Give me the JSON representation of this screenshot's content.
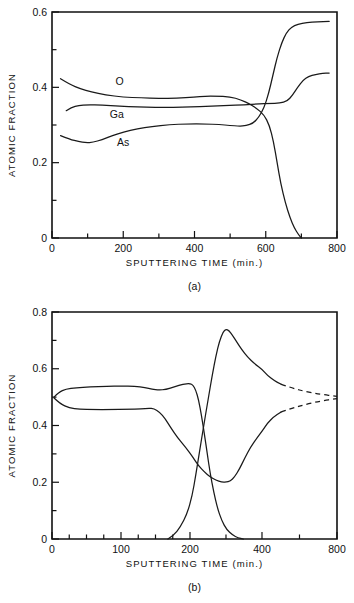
{
  "figure": {
    "title": "",
    "panels": [
      "a",
      "b"
    ]
  },
  "chart_data": [
    {
      "type": "line",
      "panel": "a",
      "caption": "(a)",
      "title": "",
      "xlabel": "SPUTTERING TIME (min.)",
      "ylabel": "ATOMIC FRACTION",
      "xlim": [
        0,
        800
      ],
      "ylim": [
        0,
        0.6
      ],
      "xticks": [
        0,
        100,
        200,
        300,
        400,
        500,
        600,
        700,
        800
      ],
      "xticklabels": [
        "0",
        "",
        "200",
        "",
        "400",
        "",
        "600",
        "",
        "800"
      ],
      "yticks": [
        0,
        0.1,
        0.2,
        0.3,
        0.4,
        0.5,
        0.6
      ],
      "yticklabels": [
        "0",
        "",
        "0.2",
        "",
        "0.4",
        "",
        "0.6"
      ],
      "x_scale": "linear",
      "grid": false,
      "legend": "inline-annotations",
      "series": [
        {
          "name": "O",
          "label": "O",
          "label_x": 190,
          "label_y": 0.415,
          "points": [
            [
              24,
              0.423
            ],
            [
              50,
              0.408
            ],
            [
              80,
              0.396
            ],
            [
              110,
              0.388
            ],
            [
              150,
              0.38
            ],
            [
              200,
              0.374
            ],
            [
              250,
              0.372
            ],
            [
              300,
              0.371
            ],
            [
              350,
              0.371
            ],
            [
              400,
              0.374
            ],
            [
              430,
              0.377
            ],
            [
              460,
              0.377
            ],
            [
              500,
              0.375
            ],
            [
              530,
              0.367
            ],
            [
              555,
              0.356
            ],
            [
              575,
              0.344
            ],
            [
              595,
              0.327
            ],
            [
              610,
              0.3
            ],
            [
              622,
              0.255
            ],
            [
              632,
              0.2
            ],
            [
              642,
              0.145
            ],
            [
              655,
              0.093
            ],
            [
              668,
              0.054
            ],
            [
              680,
              0.027
            ],
            [
              692,
              0.009
            ],
            [
              700,
              0.0
            ]
          ]
        },
        {
          "name": "Ga",
          "label": "Ga",
          "label_x": 182,
          "label_y": 0.328,
          "points": [
            [
              40,
              0.338
            ],
            [
              55,
              0.347
            ],
            [
              75,
              0.352
            ],
            [
              100,
              0.354
            ],
            [
              140,
              0.353
            ],
            [
              190,
              0.35
            ],
            [
              240,
              0.348
            ],
            [
              290,
              0.347
            ],
            [
              340,
              0.347
            ],
            [
              390,
              0.348
            ],
            [
              440,
              0.35
            ],
            [
              490,
              0.352
            ],
            [
              540,
              0.354
            ],
            [
              580,
              0.356
            ],
            [
              610,
              0.357
            ],
            [
              640,
              0.358
            ],
            [
              660,
              0.363
            ],
            [
              675,
              0.379
            ],
            [
              690,
              0.401
            ],
            [
              705,
              0.419
            ],
            [
              720,
              0.429
            ],
            [
              740,
              0.434
            ],
            [
              760,
              0.437
            ],
            [
              778,
              0.438
            ]
          ]
        },
        {
          "name": "As",
          "label": "As",
          "label_x": 200,
          "label_y": 0.253,
          "points": [
            [
              24,
              0.272
            ],
            [
              50,
              0.262
            ],
            [
              75,
              0.256
            ],
            [
              95,
              0.253
            ],
            [
              115,
              0.254
            ],
            [
              140,
              0.261
            ],
            [
              170,
              0.272
            ],
            [
              200,
              0.281
            ],
            [
              240,
              0.29
            ],
            [
              280,
              0.296
            ],
            [
              330,
              0.301
            ],
            [
              380,
              0.303
            ],
            [
              430,
              0.303
            ],
            [
              470,
              0.301
            ],
            [
              500,
              0.299
            ],
            [
              525,
              0.297
            ],
            [
              545,
              0.298
            ],
            [
              565,
              0.305
            ],
            [
              580,
              0.32
            ],
            [
              595,
              0.345
            ],
            [
              608,
              0.383
            ],
            [
              620,
              0.432
            ],
            [
              632,
              0.48
            ],
            [
              645,
              0.519
            ],
            [
              658,
              0.545
            ],
            [
              672,
              0.56
            ],
            [
              690,
              0.568
            ],
            [
              715,
              0.572
            ],
            [
              745,
              0.574
            ],
            [
              778,
              0.575
            ]
          ]
        }
      ]
    },
    {
      "type": "line",
      "panel": "b",
      "caption": "(b)",
      "title": "",
      "xlabel": "SPUTTERING TIME (min.)",
      "ylabel": "ATOMIC FRACTION",
      "xlim": [
        0,
        800
      ],
      "ylim": [
        0,
        0.8
      ],
      "xticks": [
        0,
        25,
        50,
        75,
        100,
        125,
        150,
        175,
        200,
        300,
        400,
        600,
        800
      ],
      "xticklabels": [
        "0",
        "",
        "",
        "",
        "100",
        "",
        "",
        "",
        "200",
        "",
        "400",
        "",
        "800"
      ],
      "yticks": [
        0,
        0.1,
        0.2,
        0.3,
        0.4,
        0.5,
        0.6,
        0.7,
        0.8
      ],
      "yticklabels": [
        "0",
        "",
        "0.2",
        "",
        "0.4",
        "",
        "0.6",
        "",
        "0.8"
      ],
      "x_scale": "broken-compressed",
      "x_breakpoints": [
        [
          0,
          200
        ],
        [
          200,
          400
        ],
        [
          400,
          800
        ]
      ],
      "grid": false,
      "legend": "none",
      "series": [
        {
          "name": "upper-branch",
          "label": "",
          "points": [
            [
              3,
              0.5
            ],
            [
              10,
              0.518
            ],
            [
              20,
              0.528
            ],
            [
              35,
              0.533
            ],
            [
              55,
              0.536
            ],
            [
              80,
              0.538
            ],
            [
              100,
              0.539
            ],
            [
              120,
              0.538
            ],
            [
              135,
              0.534
            ],
            [
              145,
              0.528
            ],
            [
              155,
              0.525
            ],
            [
              165,
              0.527
            ],
            [
              178,
              0.537
            ],
            [
              190,
              0.546
            ],
            [
              200,
              0.548
            ],
            [
              208,
              0.543
            ],
            [
              216,
              0.525
            ],
            [
              224,
              0.49
            ],
            [
              232,
              0.435
            ],
            [
              240,
              0.37
            ],
            [
              248,
              0.3
            ],
            [
              256,
              0.232
            ],
            [
              266,
              0.165
            ],
            [
              276,
              0.11
            ],
            [
              288,
              0.065
            ],
            [
              302,
              0.033
            ],
            [
              318,
              0.014
            ],
            [
              334,
              0.004
            ],
            [
              348,
              0.0
            ]
          ],
          "dashed": false
        },
        {
          "name": "lower-branch",
          "label": "",
          "points": [
            [
              3,
              0.497
            ],
            [
              12,
              0.476
            ],
            [
              25,
              0.462
            ],
            [
              40,
              0.457
            ],
            [
              60,
              0.456
            ],
            [
              85,
              0.456
            ],
            [
              110,
              0.457
            ],
            [
              130,
              0.458
            ],
            [
              140,
              0.461
            ],
            [
              148,
              0.459
            ],
            [
              156,
              0.447
            ],
            [
              164,
              0.424
            ],
            [
              172,
              0.393
            ],
            [
              182,
              0.357
            ],
            [
              194,
              0.322
            ],
            [
              208,
              0.288
            ],
            [
              224,
              0.258
            ],
            [
              240,
              0.236
            ],
            [
              256,
              0.219
            ],
            [
              272,
              0.207
            ],
            [
              288,
              0.201
            ],
            [
              300,
              0.2
            ],
            [
              312,
              0.204
            ],
            [
              324,
              0.219
            ],
            [
              338,
              0.248
            ],
            [
              352,
              0.285
            ],
            [
              368,
              0.323
            ],
            [
              386,
              0.356
            ],
            [
              404,
              0.383
            ],
            [
              430,
              0.409
            ],
            [
              462,
              0.43
            ],
            [
              500,
              0.447
            ]
          ],
          "dashed": false
        },
        {
          "name": "rising-branch",
          "label": "",
          "points": [
            [
              168,
              0.0
            ],
            [
              176,
              0.012
            ],
            [
              186,
              0.042
            ],
            [
              196,
              0.09
            ],
            [
              206,
              0.152
            ],
            [
              216,
              0.225
            ],
            [
              226,
              0.305
            ],
            [
              238,
              0.398
            ],
            [
              250,
              0.49
            ],
            [
              262,
              0.578
            ],
            [
              272,
              0.645
            ],
            [
              282,
              0.698
            ],
            [
              292,
              0.73
            ],
            [
              300,
              0.739
            ],
            [
              308,
              0.735
            ],
            [
              318,
              0.718
            ],
            [
              330,
              0.694
            ],
            [
              344,
              0.667
            ],
            [
              360,
              0.641
            ],
            [
              380,
              0.617
            ],
            [
              402,
              0.597
            ],
            [
              430,
              0.576
            ],
            [
              465,
              0.558
            ],
            [
              500,
              0.546
            ]
          ],
          "dashed": false
        },
        {
          "name": "upper-extrapolation",
          "label": "",
          "points": [
            [
              500,
              0.546
            ],
            [
              560,
              0.532
            ],
            [
              630,
              0.52
            ],
            [
              710,
              0.51
            ],
            [
              800,
              0.503
            ]
          ],
          "dashed": true
        },
        {
          "name": "lower-extrapolation",
          "label": "",
          "points": [
            [
              500,
              0.447
            ],
            [
              560,
              0.461
            ],
            [
              630,
              0.474
            ],
            [
              710,
              0.486
            ],
            [
              800,
              0.495
            ]
          ],
          "dashed": true
        }
      ]
    }
  ]
}
